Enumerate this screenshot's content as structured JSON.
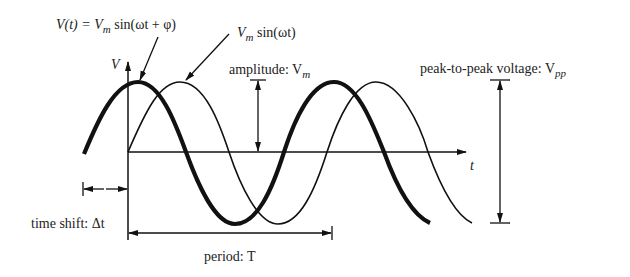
{
  "diagram": {
    "title_formula": {
      "lhs": "V(t) = V",
      "sub": "m",
      "rhs": " sin(ωt + φ)"
    },
    "reference_formula": {
      "main": "V",
      "sub": "m",
      "rest": " sin(ωt)"
    },
    "axis_labels": {
      "y": "V",
      "x": "t"
    },
    "annotations": {
      "amplitude": {
        "text": "amplitude: V",
        "sub": "m"
      },
      "peak_to_peak": {
        "text": "peak-to-peak voltage: V",
        "sub": "pp"
      },
      "time_shift": {
        "text": "time shift: Δt"
      },
      "period": {
        "text": "period: T"
      }
    },
    "curves": [
      {
        "name": "shifted-sine",
        "label": "V(t) = Vm sin(ωt + φ)",
        "stroke": "thick"
      },
      {
        "name": "reference-sine",
        "label": "Vm sin(ωt)",
        "stroke": "thin"
      }
    ],
    "colors": {
      "ink": "#111111",
      "text": "#222222",
      "background": "#ffffff"
    }
  }
}
